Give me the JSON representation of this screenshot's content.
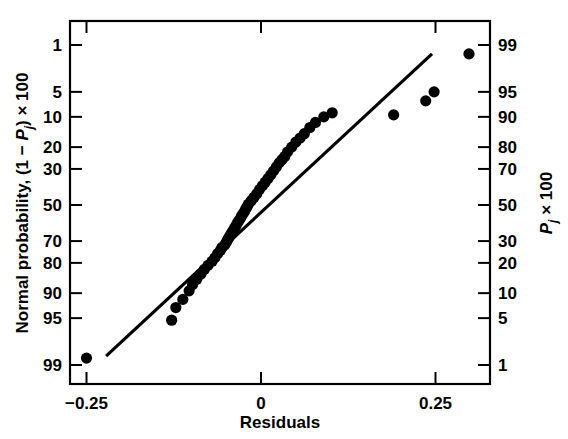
{
  "chart_data": {
    "type": "scatter",
    "title": "",
    "xlabel": "Residuals",
    "ylabel_left": "Normal probability, (1 − Pj) × 100",
    "ylabel_right": "Pj × 100",
    "xlim": [
      -0.29,
      0.31
    ],
    "xticks": [
      -0.25,
      0,
      0.25
    ],
    "xtick_labels": [
      "−0.25",
      "0",
      "0.25"
    ],
    "left_axis_ticks": [
      1,
      5,
      10,
      20,
      30,
      50,
      70,
      80,
      90,
      95,
      99
    ],
    "left_axis_tick_labels": [
      "1",
      "5",
      "10",
      "20",
      "30",
      "50",
      "70",
      "80",
      "90",
      "95",
      "99"
    ],
    "right_axis_ticks": [
      99,
      95,
      90,
      80,
      70,
      50,
      30,
      20,
      10,
      5,
      1
    ],
    "right_axis_tick_labels": [
      "99",
      "95",
      "90",
      "80",
      "70",
      "50",
      "30",
      "20",
      "10",
      "5",
      "1"
    ],
    "grid": false,
    "legend": "none",
    "probability_scale": "normal",
    "reference_line": {
      "label": "normal reference line",
      "x_start": -0.222,
      "y_start_pct_left": 98.6,
      "x_end": 0.245,
      "y_end_pct_left": 1.4
    },
    "points_note": "Each point: residual (x) vs plotting position (1 - Pj) x 100 on left probability scale",
    "x": [
      -0.25,
      -0.128,
      -0.122,
      -0.112,
      -0.103,
      -0.098,
      -0.092,
      -0.086,
      -0.081,
      -0.076,
      -0.07,
      -0.066,
      -0.062,
      -0.058,
      -0.056,
      -0.052,
      -0.05,
      -0.048,
      -0.046,
      -0.044,
      -0.042,
      -0.04,
      -0.038,
      -0.036,
      -0.034,
      -0.032,
      -0.03,
      -0.028,
      -0.026,
      -0.024,
      -0.022,
      -0.02,
      -0.018,
      -0.014,
      -0.01,
      -0.006,
      -0.002,
      0.002,
      0.006,
      0.01,
      0.014,
      0.018,
      0.022,
      0.026,
      0.03,
      0.034,
      0.038,
      0.044,
      0.05,
      0.056,
      0.062,
      0.07,
      0.078,
      0.09,
      0.102,
      0.19,
      0.236,
      0.248,
      0.298
    ],
    "y_left_pct": [
      98.7,
      95.3,
      93.2,
      91.5,
      89.4,
      87.6,
      86.0,
      84.2,
      82.5,
      81.0,
      79.3,
      77.8,
      76.0,
      74.5,
      73.2,
      72.0,
      70.8,
      69.5,
      68.2,
      67.0,
      65.8,
      64.5,
      63.2,
      62.0,
      60.5,
      59.2,
      58.0,
      56.5,
      55.2,
      54.0,
      52.5,
      51.0,
      49.5,
      47.5,
      45.5,
      43.5,
      41.0,
      39.0,
      37.0,
      35.0,
      33.0,
      31.0,
      29.0,
      27.0,
      25.5,
      24.0,
      22.0,
      20.0,
      18.0,
      16.5,
      15.0,
      13.0,
      11.5,
      10.0,
      9.0,
      9.5,
      6.5,
      5.0,
      1.4
    ]
  },
  "axes": {
    "x_axis_title": "Residuals",
    "y_axis_left_prefix": "Normal probability, (1 − ",
    "y_axis_left_symbol": "P",
    "y_axis_left_subscript": "j",
    "y_axis_left_suffix": ") × 100",
    "y_axis_right_symbol": "P",
    "y_axis_right_subscript": "j",
    "y_axis_right_suffix": " × 100"
  }
}
